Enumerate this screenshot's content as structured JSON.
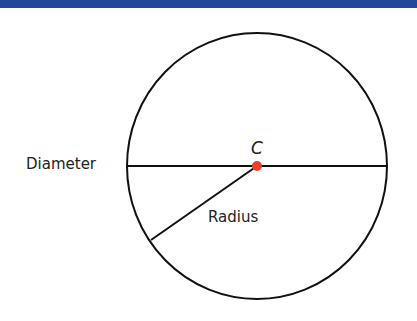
{
  "header": {
    "bar_color": "#1f4a9a"
  },
  "diagram": {
    "center_label": "C",
    "diameter_label": "Diameter",
    "radius_label": "Radius",
    "center_color": "#e8402a",
    "stroke_color": "#111111"
  }
}
